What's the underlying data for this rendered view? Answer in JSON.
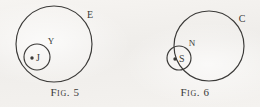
{
  "page": {
    "background_color": "#f3f1ee",
    "ink_color": "#3b3a38",
    "width": 260,
    "height": 107
  },
  "figures": [
    {
      "id": "figure-5",
      "caption_prefix": "Fig.",
      "caption_number": "5",
      "caption": "Fig. 5",
      "outer_circle": {
        "label": "E",
        "cx": 54,
        "cy": 44,
        "r": 38,
        "label_x": 90,
        "label_y": 18
      },
      "inner_circle": {
        "label": "Y",
        "cx": 37,
        "cy": 57,
        "r": 13,
        "label_x": 51,
        "label_y": 44
      },
      "center_point": {
        "label": "J",
        "dot_x": 32,
        "dot_y": 58,
        "label_x": 36,
        "label_y": 58
      }
    },
    {
      "id": "figure-6",
      "caption_prefix": "Fig.",
      "caption_number": "6",
      "caption": "Fig. 6",
      "outer_circle": {
        "label": "C",
        "cx": 79,
        "cy": 46,
        "r": 35,
        "label_x": 112,
        "label_y": 22
      },
      "inner_circle": {
        "label": "N",
        "cx": 49,
        "cy": 58,
        "r": 12,
        "label_x": 62,
        "label_y": 46
      },
      "center_point": {
        "label": "S",
        "dot_x": 45,
        "dot_y": 59,
        "label_x": 49,
        "label_y": 59
      }
    }
  ]
}
